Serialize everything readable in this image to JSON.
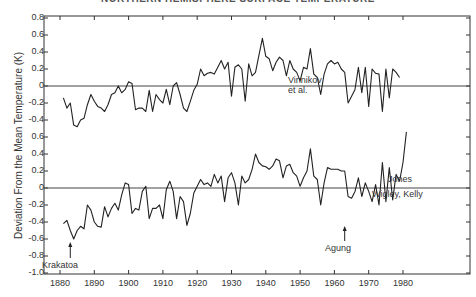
{
  "chart_data": {
    "type": "line",
    "title": "NORTHERN HEMISPHERE SURFACE TEMPERATURE",
    "xlabel": "",
    "ylabel": "Deviation From the Mean Temperature (K)",
    "xlim": [
      1876,
      2000
    ],
    "x_ticks": [
      "1880",
      "1890",
      "1900",
      "1910",
      "1920",
      "1930",
      "1940",
      "1950",
      "1960",
      "1970",
      "1980"
    ],
    "y_tick_labels": [
      "0.8",
      "0.6",
      "0.4",
      "0.2",
      "0",
      "-0.2",
      "-0.4",
      "0.6",
      "0.4",
      "0.2",
      "0",
      "-0.2",
      "-0.4",
      "-0.6",
      "-0.8",
      "-1.0"
    ],
    "grid": false,
    "legend": "inline labels at right",
    "annotations": [
      {
        "text": "Krakatoa",
        "year": 1883,
        "arrow": true
      },
      {
        "text": "Agung",
        "year": 1963,
        "arrow": true
      }
    ],
    "series": [
      {
        "name": "Vinnikov et al.",
        "label_lines": [
          "Vinnikov",
          "et al."
        ],
        "offset_note": "upper panel, zero line at upper 0",
        "x": [
          1881,
          1882,
          1883,
          1884,
          1885,
          1886,
          1887,
          1888,
          1889,
          1890,
          1891,
          1892,
          1893,
          1894,
          1895,
          1896,
          1897,
          1898,
          1899,
          1900,
          1901,
          1902,
          1903,
          1904,
          1905,
          1906,
          1907,
          1908,
          1909,
          1910,
          1911,
          1912,
          1913,
          1914,
          1915,
          1916,
          1917,
          1918,
          1919,
          1920,
          1921,
          1922,
          1923,
          1924,
          1925,
          1926,
          1927,
          1928,
          1929,
          1930,
          1931,
          1932,
          1933,
          1934,
          1935,
          1936,
          1937,
          1938,
          1939,
          1940,
          1941,
          1942,
          1943,
          1944,
          1945,
          1946,
          1947,
          1948,
          1949,
          1950,
          1951,
          1952,
          1953,
          1954,
          1955,
          1956,
          1957,
          1958,
          1959,
          1960,
          1961,
          1962,
          1963,
          1964,
          1965,
          1966,
          1967,
          1968,
          1969,
          1970,
          1971,
          1972,
          1973,
          1974,
          1975,
          1976,
          1977,
          1978,
          1979
        ],
        "values": [
          -0.14,
          -0.26,
          -0.2,
          -0.46,
          -0.48,
          -0.4,
          -0.38,
          -0.22,
          -0.1,
          -0.18,
          -0.24,
          -0.26,
          -0.3,
          -0.22,
          -0.1,
          -0.08,
          0.0,
          -0.08,
          -0.04,
          0.05,
          0.03,
          -0.28,
          -0.26,
          -0.26,
          -0.3,
          -0.05,
          -0.3,
          -0.1,
          -0.16,
          -0.2,
          -0.04,
          -0.22,
          0.0,
          0.04,
          -0.1,
          -0.26,
          -0.3,
          -0.18,
          -0.05,
          0.02,
          0.2,
          0.12,
          0.15,
          0.16,
          0.14,
          0.22,
          0.3,
          0.2,
          0.28,
          -0.12,
          0.22,
          0.25,
          0.2,
          -0.18,
          0.26,
          0.12,
          0.16,
          0.36,
          0.56,
          0.35,
          0.32,
          0.18,
          0.28,
          0.34,
          0.3,
          0.12,
          0.3,
          0.2,
          0.16,
          0.06,
          0.22,
          0.2,
          0.44,
          0.14,
          0.1,
          -0.1,
          0.14,
          0.26,
          0.3,
          0.26,
          0.28,
          0.2,
          0.16,
          -0.2,
          -0.12,
          -0.04,
          0.22,
          -0.08,
          0.22,
          -0.24,
          0.2,
          0.15,
          0.14,
          -0.3,
          0.2,
          -0.14,
          0.2,
          0.16,
          0.1
        ]
      },
      {
        "name": "Jones, Wigley, Kelly",
        "label_lines": [
          "Jones",
          "Wigley, Kelly"
        ],
        "offset_note": "lower panel, zero line at lower 0",
        "x": [
          1881,
          1882,
          1883,
          1884,
          1885,
          1886,
          1887,
          1888,
          1889,
          1890,
          1891,
          1892,
          1893,
          1894,
          1895,
          1896,
          1897,
          1898,
          1899,
          1900,
          1901,
          1902,
          1903,
          1904,
          1905,
          1906,
          1907,
          1908,
          1909,
          1910,
          1911,
          1912,
          1913,
          1914,
          1915,
          1916,
          1917,
          1918,
          1919,
          1920,
          1921,
          1922,
          1923,
          1924,
          1925,
          1926,
          1927,
          1928,
          1929,
          1930,
          1931,
          1932,
          1933,
          1934,
          1935,
          1936,
          1937,
          1938,
          1939,
          1940,
          1941,
          1942,
          1943,
          1944,
          1945,
          1946,
          1947,
          1948,
          1949,
          1950,
          1951,
          1952,
          1953,
          1954,
          1955,
          1956,
          1957,
          1958,
          1959,
          1960,
          1961,
          1962,
          1963,
          1964,
          1965,
          1966,
          1967,
          1968,
          1969,
          1970,
          1971,
          1972,
          1973,
          1974,
          1975,
          1976,
          1977,
          1978,
          1979,
          1980,
          1981
        ],
        "values": [
          -0.42,
          -0.38,
          -0.5,
          -0.6,
          -0.5,
          -0.45,
          -0.48,
          -0.2,
          -0.26,
          -0.4,
          -0.45,
          -0.46,
          -0.22,
          -0.34,
          -0.24,
          -0.18,
          -0.26,
          -0.08,
          0.06,
          0.04,
          -0.3,
          -0.24,
          -0.26,
          -0.04,
          0.02,
          -0.36,
          -0.24,
          -0.24,
          -0.2,
          -0.36,
          -0.02,
          0.08,
          -0.04,
          -0.36,
          -0.1,
          -0.16,
          -0.44,
          -0.3,
          -0.06,
          0.02,
          0.1,
          0.04,
          0.06,
          0.02,
          0.16,
          0.06,
          0.14,
          -0.16,
          0.12,
          0.18,
          0.06,
          -0.2,
          0.14,
          0.06,
          0.1,
          0.22,
          0.4,
          0.3,
          0.26,
          0.25,
          0.22,
          0.26,
          0.34,
          0.32,
          0.12,
          0.26,
          0.28,
          0.18,
          0.14,
          0.02,
          0.12,
          0.2,
          0.46,
          0.14,
          0.1,
          -0.2,
          0.06,
          0.24,
          0.22,
          0.22,
          0.22,
          0.2,
          0.2,
          -0.1,
          -0.12,
          -0.04,
          0.12,
          -0.1,
          0.06,
          -0.04,
          -0.16,
          0.04,
          -0.2,
          0.3,
          -0.16,
          0.24,
          -0.14,
          0.16,
          0.08,
          0.3,
          0.66
        ]
      }
    ]
  }
}
